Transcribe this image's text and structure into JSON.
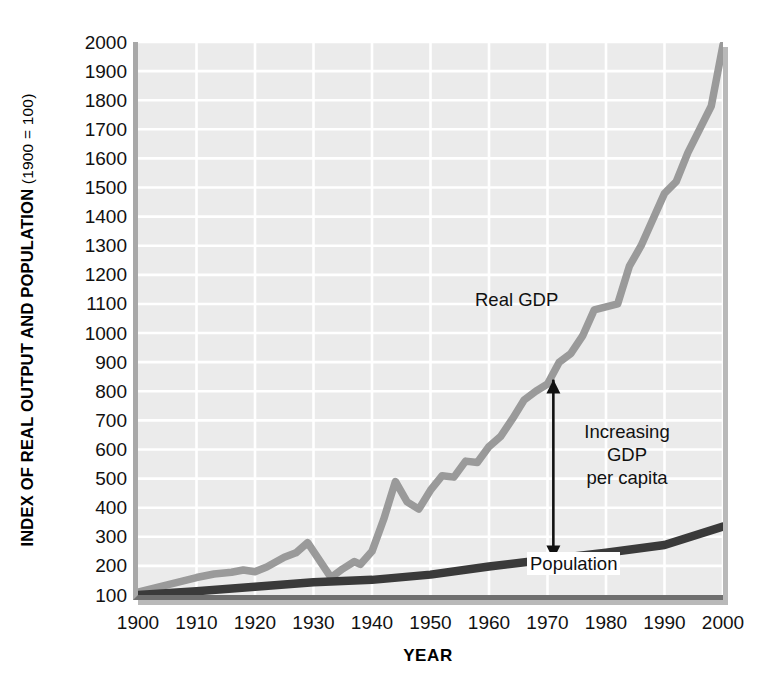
{
  "figure": {
    "y_axis_title_main": "INDEX OF REAL OUTPUT AND POPULATION",
    "y_axis_title_note": " (1900 = 100)",
    "x_axis_title": "YEAR",
    "annotations": {
      "real_gdp": "Real GDP",
      "per_capita_line1": "Increasing",
      "per_capita_line2": "GDP",
      "per_capita_line3": "per capita",
      "population": "Population"
    },
    "colors": {
      "plot_background": "#ebebeb",
      "gridline": "#ffffff",
      "real_gdp_line": "#9a9a9a",
      "population_line": "#3a3a3a",
      "annotation_arrow": "#111111",
      "axis_left": "#a8a8a8",
      "axis_bottom": "#6f6f6f"
    }
  },
  "chart_data": {
    "type": "line",
    "title": "",
    "xlabel": "YEAR",
    "ylabel": "INDEX OF REAL OUTPUT AND POPULATION (1900 = 100)",
    "xlim": [
      1900,
      2000
    ],
    "ylim": [
      100,
      2000
    ],
    "grid": true,
    "legend": "in-plot labels",
    "xticks": [
      1900,
      1910,
      1920,
      1930,
      1940,
      1950,
      1960,
      1970,
      1980,
      1990,
      2000
    ],
    "yticks": [
      100,
      200,
      300,
      400,
      500,
      600,
      700,
      800,
      900,
      1000,
      1100,
      1200,
      1300,
      1400,
      1500,
      1600,
      1700,
      1800,
      1900,
      2000
    ],
    "series": [
      {
        "name": "Real GDP",
        "color": "#9a9a9a",
        "x": [
          1900,
          1905,
          1910,
          1913,
          1916,
          1918,
          1920,
          1922,
          1925,
          1927,
          1929,
          1931,
          1933,
          1935,
          1937,
          1938,
          1940,
          1942,
          1944,
          1946,
          1948,
          1950,
          1952,
          1954,
          1956,
          1958,
          1960,
          1962,
          1964,
          1966,
          1968,
          1970,
          1972,
          1974,
          1976,
          1978,
          1980,
          1982,
          1984,
          1986,
          1988,
          1990,
          1992,
          1994,
          1996,
          1998,
          2000
        ],
        "y": [
          110,
          135,
          160,
          172,
          178,
          186,
          180,
          196,
          230,
          245,
          280,
          220,
          160,
          190,
          215,
          205,
          250,
          360,
          490,
          420,
          395,
          460,
          510,
          505,
          560,
          555,
          610,
          645,
          705,
          770,
          800,
          825,
          900,
          930,
          990,
          1080,
          1090,
          1100,
          1230,
          1300,
          1390,
          1480,
          1520,
          1620,
          1700,
          1780,
          1990
        ]
      },
      {
        "name": "Population",
        "color": "#3a3a3a",
        "x": [
          1900,
          1910,
          1920,
          1930,
          1940,
          1950,
          1960,
          1970,
          1980,
          1990,
          2000
        ],
        "y": [
          100,
          113,
          128,
          144,
          152,
          170,
          198,
          222,
          245,
          272,
          335
        ]
      }
    ],
    "annotations": [
      {
        "text": "Real GDP",
        "x": 1966,
        "y": 1075,
        "kind": "series-label"
      },
      {
        "text": "Increasing GDP per capita",
        "x": 1971,
        "y": 530,
        "kind": "double-arrow",
        "arrow_from_y": 840,
        "arrow_to_y": 222
      },
      {
        "text": "Population",
        "x": 1974,
        "y": 180,
        "kind": "series-label"
      }
    ]
  }
}
